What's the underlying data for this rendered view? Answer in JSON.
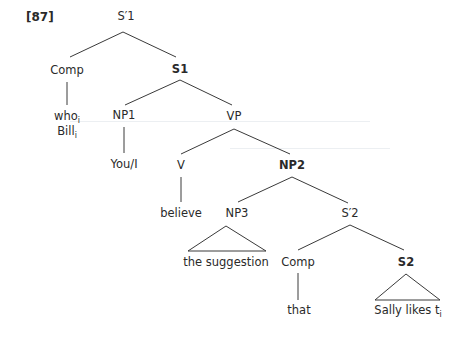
{
  "example_number": "[87]",
  "nodes": {
    "s_bar_1": "S′1",
    "comp_1": "Comp",
    "s1": "S1",
    "who": "who",
    "who_sub": "i",
    "bill": "Bill",
    "bill_sub": "i",
    "np1": "NP1",
    "vp": "VP",
    "you_i": "You/I",
    "v": "V",
    "np2": "NP2",
    "believe": "believe",
    "np3": "NP3",
    "s_bar_2": "S′2",
    "the_suggestion": "the suggestion",
    "comp_2": "Comp",
    "s2": "S2",
    "that": "that",
    "sally_likes": "Sally likes t",
    "sally_sub": "i"
  },
  "colors": {
    "line": "#3a3a3a",
    "text": "#2a2a2a"
  }
}
